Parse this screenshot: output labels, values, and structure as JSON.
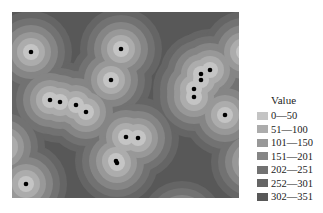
{
  "map": {
    "background": "#585858",
    "points": [
      {
        "x": 19,
        "y": 40
      },
      {
        "x": 109,
        "y": 37
      },
      {
        "x": 99,
        "y": 68
      },
      {
        "x": 38,
        "y": 88
      },
      {
        "x": 48,
        "y": 90
      },
      {
        "x": 64,
        "y": 93
      },
      {
        "x": 74,
        "y": 100
      },
      {
        "x": 114,
        "y": 125
      },
      {
        "x": 126,
        "y": 126
      },
      {
        "x": 104,
        "y": 149
      },
      {
        "x": 105,
        "y": 151
      },
      {
        "x": 198,
        "y": 58
      },
      {
        "x": 189,
        "y": 62
      },
      {
        "x": 189,
        "y": 68
      },
      {
        "x": 182,
        "y": 77
      },
      {
        "x": 182,
        "y": 85
      },
      {
        "x": 213,
        "y": 103
      },
      {
        "x": 14,
        "y": 172
      }
    ],
    "edge_sources": [
      {
        "x": 232,
        "y": 40
      },
      {
        "x": 240,
        "y": 150
      },
      {
        "x": -8,
        "y": 135
      },
      {
        "x": 170,
        "y": 210
      }
    ]
  },
  "legend": {
    "title": "Value",
    "items": [
      {
        "label": "0—50",
        "color": "#c4c4c4"
      },
      {
        "label": "51—100",
        "color": "#acacac"
      },
      {
        "label": "101—150",
        "color": "#989898"
      },
      {
        "label": "151—201",
        "color": "#858585"
      },
      {
        "label": "202—251",
        "color": "#727272"
      },
      {
        "label": "252—301",
        "color": "#656565"
      },
      {
        "label": "302—351",
        "color": "#585858"
      }
    ]
  }
}
